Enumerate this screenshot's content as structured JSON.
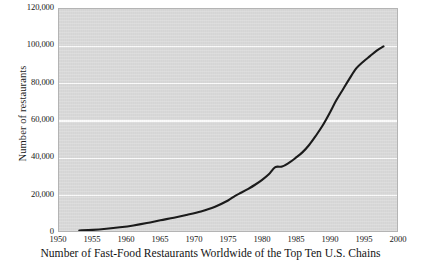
{
  "caption": "Number of Fast-Food Restaurants Worldwide of the Top Ten U.S. Chains",
  "chart_data": {
    "type": "line",
    "title": "",
    "subtitle": "",
    "xlabel": "",
    "ylabel": "Number of restaurants",
    "xlim": [
      1950,
      2000
    ],
    "ylim": [
      0,
      120000
    ],
    "grid": true,
    "legend": "none",
    "plot_background": "#d8d8d8",
    "gridline_color": "#fbfbfb",
    "line_color": "#1b1b1b",
    "xticks": [
      1950,
      1955,
      1960,
      1965,
      1970,
      1975,
      1980,
      1985,
      1990,
      1995,
      2000
    ],
    "xtick_labels": [
      "1950",
      "1955",
      "1960",
      "1965",
      "1970",
      "1975",
      "1980",
      "1985",
      "1990",
      "1995",
      "2000"
    ],
    "yticks": [
      0,
      20000,
      40000,
      60000,
      80000,
      100000,
      120000
    ],
    "ytick_labels": [
      "0",
      "20,000",
      "40,000",
      "60,000",
      "80,000",
      "100,000",
      "120,000"
    ],
    "series": [
      {
        "name": "Number of restaurants",
        "x": [
          1953,
          1955,
          1957,
          1959,
          1961,
          1963,
          1965,
          1967,
          1969,
          1971,
          1973,
          1975,
          1976,
          1977,
          1978,
          1979,
          1980,
          1981,
          1982,
          1983,
          1984,
          1985,
          1986,
          1987,
          1988,
          1989,
          1990,
          1991,
          1992,
          1993,
          1994,
          1995,
          1996,
          1997,
          1998
        ],
        "y": [
          300,
          600,
          1200,
          2000,
          3000,
          4300,
          5800,
          7200,
          8800,
          10600,
          13000,
          16500,
          18900,
          20800,
          22800,
          25000,
          27500,
          30500,
          34500,
          34800,
          36800,
          39500,
          42500,
          46500,
          51500,
          57000,
          63500,
          70500,
          76500,
          82500,
          88000,
          91500,
          94500,
          97500,
          99800
        ]
      }
    ],
    "annotations": [
      {
        "label": "plateau",
        "x_range": [
          1981,
          1983
        ],
        "y": 34800
      }
    ]
  }
}
